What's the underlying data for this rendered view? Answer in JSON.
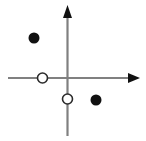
{
  "figure": {
    "canvas": {
      "width": 146,
      "height": 141,
      "background": "#ffffff"
    },
    "origin": {
      "x": 67.5,
      "y": 78
    }
  },
  "axes": {
    "x_axis": {
      "name": "x-axis",
      "color": "#808080",
      "stroke_width": 2.2,
      "x_start": 8,
      "x_end": 129,
      "y": 78,
      "arrow": {
        "name": "x-axis-arrow",
        "direction": "right",
        "color": "#111111",
        "tip_x": 140,
        "tip_y": 78,
        "base_x": 128,
        "half_height": 5
      }
    },
    "y_axis": {
      "name": "y-axis",
      "color": "#808080",
      "stroke_width": 2.2,
      "y_start": 12,
      "y_end": 136,
      "x": 67.5,
      "arrow": {
        "name": "y-axis-arrow",
        "direction": "up",
        "color": "#111111",
        "tip_x": 67.5,
        "tip_y": 5,
        "base_y": 18,
        "half_width": 4.5
      }
    }
  },
  "chart_data": {
    "type": "scatter",
    "xlabel": "",
    "ylabel": "",
    "grid": false,
    "legend": null,
    "xlim": [
      -67.5,
      78.5
    ],
    "ylim": [
      -63,
      78
    ],
    "axis_units": "pixels from origin",
    "marker_styles": {
      "filled": {
        "name": "closed-circle",
        "fill": "#111111",
        "stroke": "none",
        "radius": 5.5,
        "meaning": "included endpoint"
      },
      "open": {
        "name": "open-circle",
        "fill": "#ffffff",
        "stroke": "#2b2b2b",
        "stroke_width": 1.6,
        "radius": 5.0,
        "meaning": "excluded endpoint"
      }
    },
    "points": [
      {
        "id": "point-1",
        "name": "filled-point-upper-left",
        "style": "filled",
        "quadrant": "II",
        "cx": 34,
        "cy": 38,
        "x": -33.5,
        "y": 40
      },
      {
        "id": "point-2",
        "name": "open-point-on-x-axis",
        "style": "open",
        "quadrant": "on negative x-axis",
        "cx": 42.5,
        "cy": 78,
        "x": -25,
        "y": 0
      },
      {
        "id": "point-3",
        "name": "open-point-on-y-axis",
        "style": "open",
        "quadrant": "on negative y-axis",
        "cx": 67.5,
        "cy": 99,
        "x": 0,
        "y": -21
      },
      {
        "id": "point-4",
        "name": "filled-point-lower-right",
        "style": "filled",
        "quadrant": "IV",
        "cx": 96,
        "cy": 100,
        "x": 28.5,
        "y": -22
      }
    ]
  }
}
